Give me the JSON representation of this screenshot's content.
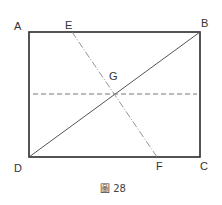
{
  "figure": {
    "caption": "圖 28",
    "colors": {
      "rectangle": "#2a2a2a",
      "diagonal": "#555555",
      "dashed": "#777777",
      "dashdot": "#888888",
      "label": "#333333"
    },
    "points": {
      "A": {
        "label": "A",
        "x": 29,
        "y": 32
      },
      "B": {
        "label": "B",
        "x": 200,
        "y": 32
      },
      "C": {
        "label": "C",
        "x": 200,
        "y": 157
      },
      "D": {
        "label": "D",
        "x": 29,
        "y": 157
      },
      "E": {
        "label": "E",
        "x": 72,
        "y": 32
      },
      "F": {
        "label": "F",
        "x": 157,
        "y": 157
      },
      "G": {
        "label": "G",
        "x": 114,
        "y": 94
      }
    },
    "segments": [
      {
        "name": "rectangle-ABCD",
        "style": "solid"
      },
      {
        "name": "diagonal-DB",
        "from": "D",
        "to": "B",
        "style": "solid"
      },
      {
        "name": "line-EF",
        "from": "E",
        "to": "F",
        "style": "dash-dot"
      },
      {
        "name": "horizontal-midline",
        "style": "dashed"
      }
    ]
  }
}
